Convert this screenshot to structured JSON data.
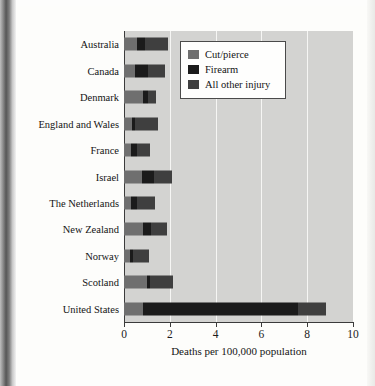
{
  "chart_data": {
    "type": "bar",
    "orientation": "horizontal",
    "stacked": true,
    "title": "",
    "xlabel": "Deaths per 100,000 population",
    "ylabel": "",
    "xlim": [
      0,
      10
    ],
    "xticks": [
      0,
      2,
      4,
      6,
      8,
      10
    ],
    "xtick_labels": [
      "0",
      "2",
      "4",
      "6",
      "8",
      "10"
    ],
    "grid": "vertical-white-gridlines",
    "plot_background": "#d3d3d1",
    "legend_position": "top-right-inside",
    "categories": [
      "Australia",
      "Canada",
      "Denmark",
      "England and Wales",
      "France",
      "Israel",
      "The Netherlands",
      "New Zealand",
      "Norway",
      "Scotland",
      "United States"
    ],
    "series": [
      {
        "name": "Cut/pierce",
        "color": "#6f6f6f",
        "values": [
          0.55,
          0.5,
          0.85,
          0.35,
          0.3,
          0.8,
          0.3,
          0.85,
          0.25,
          1.0,
          0.85
        ]
      },
      {
        "name": "Firearm",
        "color": "#1b1b1b",
        "values": [
          0.35,
          0.55,
          0.2,
          0.15,
          0.25,
          0.5,
          0.25,
          0.35,
          0.15,
          0.15,
          6.75
        ]
      },
      {
        "name": "All other injury",
        "color": "#3f3f3f",
        "values": [
          1.0,
          0.75,
          0.35,
          1.0,
          0.6,
          0.8,
          0.8,
          0.7,
          0.7,
          1.0,
          1.2
        ]
      }
    ],
    "totals": [
      1.9,
      1.8,
      1.4,
      1.5,
      1.15,
      2.1,
      1.35,
      1.9,
      1.1,
      2.15,
      8.8
    ]
  },
  "legend": {
    "items": [
      {
        "label": "Cut/pierce",
        "color": "#6f6f6f"
      },
      {
        "label": "Firearm",
        "color": "#1b1b1b"
      },
      {
        "label": "All other injury",
        "color": "#3f3f3f"
      }
    ]
  }
}
